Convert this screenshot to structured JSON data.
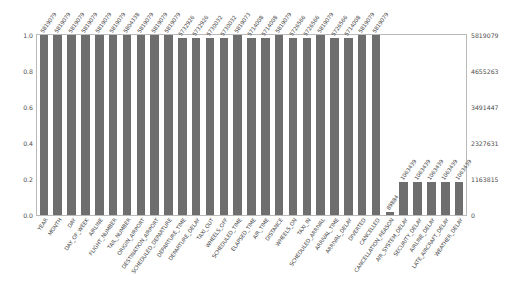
{
  "chart_data": {
    "type": "bar",
    "title": "",
    "xlabel": "",
    "ylabel": "",
    "ylim": [
      0.0,
      1.0
    ],
    "grid": false,
    "legend": null,
    "bar_color": "#6e6e6e",
    "left_axis": {
      "ticks": [
        "0.0",
        "0.2",
        "0.4",
        "0.6",
        "0.8",
        "1.0"
      ],
      "values": [
        0.0,
        0.2,
        0.4,
        0.6,
        0.8,
        1.0
      ]
    },
    "right_axis": {
      "ticks": [
        "0",
        "1163815",
        "2327631",
        "3491447",
        "4655263",
        "5819079"
      ],
      "values": [
        0,
        1163815,
        2327631,
        3491447,
        4655263,
        5819079
      ]
    },
    "categories": [
      "YEAR",
      "MONTH",
      "DAY",
      "DAY_OF_WEEK",
      "AIRLINE",
      "FLIGHT_NUMBER",
      "TAIL_NUMBER",
      "ORIGIN_AIRPORT",
      "DESTINATION_AIRPORT",
      "SCHEDULED_DEPARTURE",
      "DEPARTURE_TIME",
      "DEPARTURE_DELAY",
      "TAXI_OUT",
      "WHEELS_OFF",
      "SCHEDULED_TIME",
      "ELAPSED_TIME",
      "AIR_TIME",
      "DISTANCE",
      "WHEELS_ON",
      "TAXI_IN",
      "SCHEDULED_ARRIVAL",
      "ARRIVAL_TIME",
      "ARRIVAL_DELAY",
      "DIVERTED",
      "CANCELLED",
      "CANCELLATION_REASON",
      "AIR_SYSTEM_DELAY",
      "SECURITY_DELAY",
      "AIRLINE_DELAY",
      "LATE_AIRCRAFT_DELAY",
      "WEATHER_DELAY"
    ],
    "values": [
      1.0,
      1.0,
      1.0,
      1.0,
      1.0,
      1.0,
      0.9974,
      1.0,
      1.0,
      1.0,
      0.9851,
      0.9851,
      0.9847,
      0.9847,
      1.0,
      0.982,
      0.982,
      1.0,
      0.9845,
      0.9845,
      1.0,
      0.9845,
      0.982,
      1.0,
      1.0,
      0.0154,
      0.1827,
      0.1827,
      0.1827,
      0.1827,
      0.1827
    ],
    "counts": [
      "5819079",
      "5819079",
      "5819079",
      "5819079",
      "5819079",
      "5819079",
      "5804338",
      "5819079",
      "5819079",
      "5819079",
      "5732926",
      "5732926",
      "5730032",
      "5730032",
      "5819073",
      "5714008",
      "5714008",
      "5819079",
      "5726566",
      "5726566",
      "5819079",
      "5726566",
      "5714008",
      "5819079",
      "5819079",
      "89884",
      "1063439",
      "1063439",
      "1063439",
      "1063439",
      "1063439"
    ]
  }
}
